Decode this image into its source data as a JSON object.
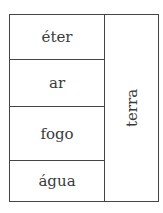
{
  "diagram": {
    "left_column": [
      {
        "label": "éter"
      },
      {
        "label": "ar"
      },
      {
        "label": "fogo"
      },
      {
        "label": "água"
      }
    ],
    "right_column": {
      "label": "terra",
      "orientation": "vertical, rotated -90deg"
    }
  }
}
